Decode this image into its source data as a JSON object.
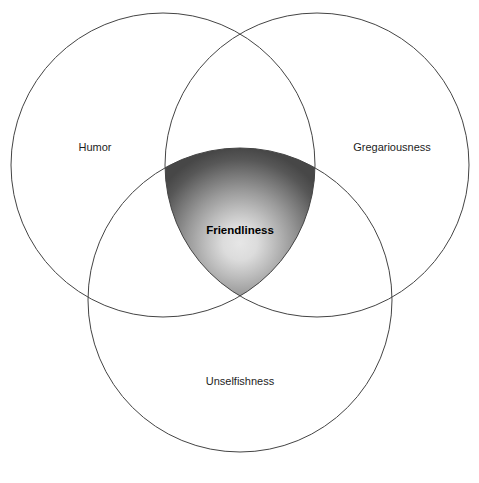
{
  "diagram": {
    "type": "venn",
    "title": "",
    "background_color": "#ffffff",
    "canvas": {
      "width": 479,
      "height": 483
    },
    "circle": {
      "radius": 152,
      "stroke_color": "#444444",
      "stroke_width": 1,
      "fill": "none"
    },
    "sets": [
      {
        "id": "humor",
        "label": "Humor",
        "position": "top-left",
        "center": {
          "x": 163,
          "y": 165
        },
        "label_position": {
          "x": 95,
          "y": 147
        },
        "bold": false
      },
      {
        "id": "gregariousness",
        "label": "Gregariousness",
        "position": "top-right",
        "center": {
          "x": 317,
          "y": 165
        },
        "label_position": {
          "x": 392,
          "y": 147
        },
        "bold": false
      },
      {
        "id": "unselfishness",
        "label": "Unselfishness",
        "position": "bottom",
        "center": {
          "x": 240,
          "y": 300
        },
        "label_position": {
          "x": 240,
          "y": 381
        },
        "bold": false
      }
    ],
    "intersection": {
      "id": "friendliness",
      "label": "Friendliness",
      "bold": true,
      "label_position": {
        "x": 240,
        "y": 230
      },
      "shape": "reuleaux-triangle",
      "vertices": [
        {
          "x": 168,
          "y": 188
        },
        {
          "x": 312,
          "y": 188
        },
        {
          "x": 240,
          "y": 298
        }
      ],
      "gradient": {
        "kind": "radial",
        "center_color": "#e2e2e2",
        "mid_color": "#9a9a9a",
        "edge_color": "#474747",
        "focus": {
          "x": 240,
          "y": 243
        }
      }
    }
  }
}
